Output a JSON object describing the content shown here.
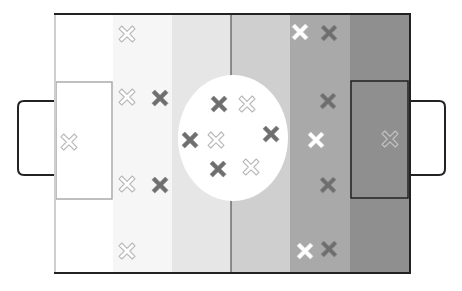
{
  "diagram": {
    "type": "football-formation",
    "pitch": {
      "x": 55,
      "y": 14,
      "width": 355,
      "height": 259,
      "stripes": [
        {
          "x": 55,
          "w": 58,
          "color": "#ffffff"
        },
        {
          "x": 113,
          "w": 59,
          "color": "#f6f6f6"
        },
        {
          "x": 172,
          "w": 59,
          "color": "#e6e6e6"
        },
        {
          "x": 231,
          "w": 59,
          "color": "#cfcfcf"
        },
        {
          "x": 290,
          "w": 60,
          "color": "#a9a9a9"
        },
        {
          "x": 350,
          "w": 60,
          "color": "#8f8f8f"
        }
      ],
      "border_color": "#222222",
      "halfway_line_x": 231,
      "center_circle": {
        "cx": 233,
        "cy": 138,
        "rx": 55,
        "ry": 63,
        "color": "#ffffff"
      },
      "penalty_boxes": [
        {
          "side": "left",
          "x": 56,
          "y": 82,
          "w": 56,
          "h": 117,
          "stroke": "#aaaaaa"
        },
        {
          "side": "right",
          "x": 351,
          "y": 81,
          "w": 57,
          "h": 117,
          "stroke": "#222222"
        }
      ],
      "goals": [
        {
          "side": "left",
          "x": 18,
          "y": 101,
          "w": 37,
          "h": 74
        },
        {
          "side": "right",
          "x": 410,
          "y": 101,
          "w": 35,
          "h": 74
        }
      ]
    },
    "markers": {
      "team_outline_white": {
        "style": "outline",
        "fill": "#ffffff",
        "stroke": "#b8b8b8",
        "positions": [
          [
            127,
            34
          ],
          [
            127,
            97
          ],
          [
            69,
            142
          ],
          [
            127,
            184
          ],
          [
            127,
            251
          ],
          [
            247,
            104
          ],
          [
            216,
            140
          ],
          [
            251,
            167
          ]
        ]
      },
      "team_dark": {
        "style": "solid",
        "fill": "#6e6e6e",
        "stroke": "#8a8a8a",
        "positions": [
          [
            160,
            98
          ],
          [
            160,
            185
          ],
          [
            219,
            104
          ],
          [
            190,
            140
          ],
          [
            218,
            169
          ],
          [
            271,
            134
          ],
          [
            329,
            33
          ],
          [
            328,
            101
          ],
          [
            328,
            185
          ],
          [
            329,
            249
          ]
        ]
      },
      "team_solid_white": {
        "style": "solid",
        "fill": "#ffffff",
        "stroke": "#dddddd",
        "positions": [
          [
            300,
            32
          ],
          [
            316,
            140
          ],
          [
            305,
            251
          ]
        ]
      },
      "goalkeeper_right": {
        "style": "outline",
        "fill": "#8f8f8f",
        "stroke": "#c4c4c4",
        "positions": [
          [
            390,
            139
          ]
        ]
      }
    }
  }
}
